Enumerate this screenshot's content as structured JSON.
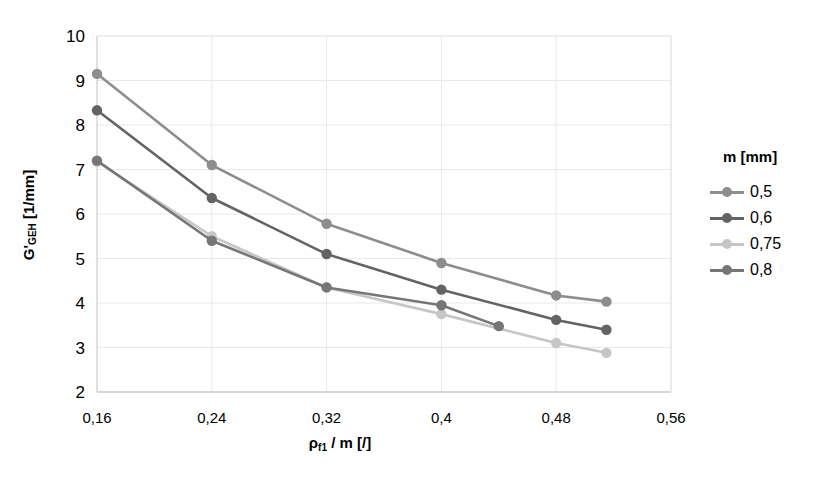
{
  "chart_data": {
    "type": "line",
    "title": "",
    "xlabel": "ρf1 / m [/]",
    "xlabel_main": "ρ",
    "xlabel_sub": "f1",
    "xlabel_rest": " / m [/]",
    "ylabel": "G'GEH [1/mm]",
    "ylabel_main": "G'",
    "ylabel_sub": "GEH",
    "ylabel_rest": " [1/mm]",
    "xlim": [
      0.16,
      0.56
    ],
    "ylim": [
      2,
      10
    ],
    "xticks": [
      "0,16",
      "0,24",
      "0,32",
      "0,4",
      "0,48",
      "0,56"
    ],
    "xtick_values": [
      0.16,
      0.24,
      0.32,
      0.4,
      0.48,
      0.56
    ],
    "yticks": [
      "10",
      "9",
      "8",
      "7",
      "6",
      "5",
      "4",
      "3",
      "2"
    ],
    "ytick_values": [
      10,
      9,
      8,
      7,
      6,
      5,
      4,
      3,
      2
    ],
    "grid": true,
    "legend_position": "right",
    "legend_title": "m [mm]",
    "series": [
      {
        "name": "0,5",
        "color": "#8d8d8d",
        "x": [
          0.16,
          0.24,
          0.32,
          0.4,
          0.48,
          0.515
        ],
        "values": [
          9.15,
          7.1,
          5.78,
          4.9,
          4.17,
          4.03
        ]
      },
      {
        "name": "0,6",
        "color": "#636363",
        "x": [
          0.16,
          0.24,
          0.32,
          0.4,
          0.48,
          0.515
        ],
        "values": [
          8.33,
          6.36,
          5.1,
          4.3,
          3.62,
          3.4
        ]
      },
      {
        "name": "0,75",
        "color": "#c6c6c6",
        "x": [
          0.16,
          0.24,
          0.32,
          0.4,
          0.48,
          0.515
        ],
        "values": [
          7.18,
          5.5,
          4.35,
          3.75,
          3.1,
          2.88
        ]
      },
      {
        "name": "0,8",
        "color": "#767676",
        "x": [
          0.16,
          0.24,
          0.32,
          0.4,
          0.44
        ],
        "values": [
          7.2,
          5.4,
          4.35,
          3.95,
          3.48
        ]
      }
    ]
  },
  "legend": {
    "title": "m [mm]",
    "items": [
      {
        "label": "0,5",
        "color": "#8d8d8d"
      },
      {
        "label": "0,6",
        "color": "#636363"
      },
      {
        "label": "0,75",
        "color": "#c6c6c6"
      },
      {
        "label": "0,8",
        "color": "#767676"
      }
    ]
  }
}
